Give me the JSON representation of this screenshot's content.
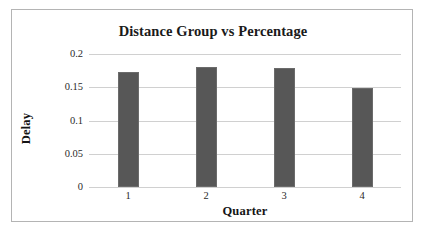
{
  "figure": {
    "background_color": "#ffffff",
    "frame_color": "#b4b4b4"
  },
  "chart_data": {
    "type": "bar",
    "title": "Distance Group vs Percentage",
    "xlabel": "Quarter",
    "ylabel": "Delay",
    "categories": [
      "1",
      "2",
      "3",
      "4"
    ],
    "values": [
      0.173,
      0.181,
      0.179,
      0.149
    ],
    "series": [
      {
        "name": "Delay",
        "values": [
          0.173,
          0.181,
          0.179,
          0.149
        ],
        "color": "#575757"
      }
    ],
    "ylim": [
      0,
      0.2
    ],
    "ytick_labels": [
      "0",
      "0.05",
      "0.1",
      "0.15",
      "0.2"
    ],
    "ytick_values": [
      0,
      0.05,
      0.1,
      0.15,
      0.2
    ],
    "grid": true,
    "grid_axis": "y",
    "grid_color": "#d0d0d0",
    "legend": false,
    "legend_position": "none",
    "bar_color": "#575757",
    "bar_edge_color": "#6b6b6b"
  }
}
